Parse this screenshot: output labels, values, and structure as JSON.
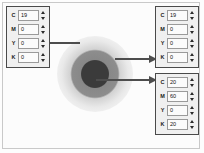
{
  "swatch": {
    "name": "radial-gradient-swatch",
    "core_color": "#3b3b3b",
    "mid_color": "#8a8a8a",
    "outer_color": "#e9e9e9",
    "background_color": "#fcfcfc"
  },
  "panels": {
    "left": {
      "title": "cmyk-panel-left",
      "rows": [
        {
          "channel": "C",
          "value": "19"
        },
        {
          "channel": "M",
          "value": "0"
        },
        {
          "channel": "Y",
          "value": "0"
        },
        {
          "channel": "K",
          "value": "0"
        }
      ]
    },
    "right_top": {
      "title": "cmyk-panel-right-top",
      "rows": [
        {
          "channel": "C",
          "value": "19"
        },
        {
          "channel": "M",
          "value": "0"
        },
        {
          "channel": "Y",
          "value": "0"
        },
        {
          "channel": "K",
          "value": "0"
        }
      ]
    },
    "right_bottom": {
      "title": "cmyk-panel-right-bottom",
      "rows": [
        {
          "channel": "C",
          "value": "20"
        },
        {
          "channel": "M",
          "value": "60"
        },
        {
          "channel": "Y",
          "value": "0"
        },
        {
          "channel": "K",
          "value": "20"
        }
      ]
    }
  },
  "arrows": [
    {
      "name": "arrow-to-left-panel",
      "direction": "left"
    },
    {
      "name": "arrow-to-right-top-panel",
      "direction": "right"
    },
    {
      "name": "arrow-to-right-bottom-panel",
      "direction": "right"
    }
  ],
  "colors": {
    "arrow": "#4d4d4d",
    "panel_border": "#4a4a4a",
    "panel_fill": "#f0f0f0",
    "field_fill": "#fbfbfb",
    "frame_border": "#c9c9c9"
  }
}
